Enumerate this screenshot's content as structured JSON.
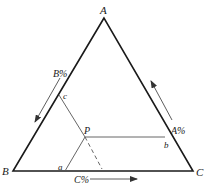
{
  "diagram": {
    "type": "ternary-phase-diagram",
    "vertices": {
      "top": "A",
      "bottom_left": "B",
      "bottom_right": "C"
    },
    "point": "P",
    "intersections": {
      "on_AB": "c",
      "on_AC": "b",
      "on_BC": "a"
    },
    "axis_labels": {
      "left_side": "B%",
      "right_side": "A%",
      "bottom": "C%"
    },
    "colors": {
      "outline": "#1a1a1a",
      "construction": "#555555"
    }
  }
}
